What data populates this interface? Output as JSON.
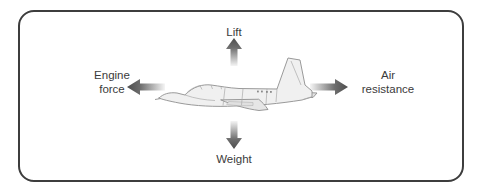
{
  "diagram": {
    "center_image": "airplane-side-view",
    "forces": [
      {
        "id": "lift",
        "label": "Lift",
        "position": "top",
        "direction": "up"
      },
      {
        "id": "weight",
        "label": "Weight",
        "position": "bottom",
        "direction": "down"
      },
      {
        "id": "engine-force",
        "label": "Engine force",
        "line1": "Engine",
        "line2": "force",
        "position": "left",
        "direction": "left"
      },
      {
        "id": "air-resistance",
        "label": "Air resistance",
        "line1": "Air",
        "line2": "resistance",
        "position": "right",
        "direction": "right"
      }
    ],
    "colors": {
      "frame_border": "#3d3d3d",
      "text": "#3b3b3b",
      "arrow_dark": "#4d4d4d",
      "arrow_light": "#f5f5f5",
      "plane_fill": "#f0f0f0",
      "plane_outline": "#8f8f8f",
      "background": "#ffffff"
    }
  }
}
